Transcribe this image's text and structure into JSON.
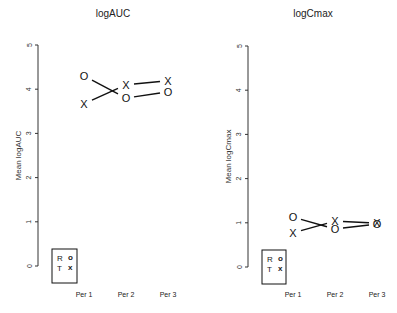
{
  "chart_data": [
    {
      "type": "line",
      "title": "logAUC",
      "xlabel": "",
      "ylabel": "Mean logAUC",
      "ylim": [
        0,
        5
      ],
      "yticks": [
        0,
        1,
        2,
        3,
        4,
        5
      ],
      "categories": [
        "Per 1",
        "Per 2",
        "Per 3"
      ],
      "grid": false,
      "legend": {
        "position": "bottom-left",
        "entries": [
          {
            "label": "R",
            "symbol": "O"
          },
          {
            "label": "T",
            "symbol": "X"
          }
        ]
      },
      "series": [
        {
          "name": "R",
          "symbol": "O",
          "values": [
            4.3,
            3.8,
            3.94
          ]
        },
        {
          "name": "T",
          "symbol": "X",
          "values": [
            3.67,
            4.1,
            4.19
          ]
        }
      ]
    },
    {
      "type": "line",
      "title": "logCmax",
      "xlabel": "",
      "ylabel": "Mean logCmax",
      "ylim": [
        0,
        5
      ],
      "yticks": [
        0,
        1,
        2,
        3,
        4,
        5
      ],
      "categories": [
        "Per 1",
        "Per 2",
        "Per 3"
      ],
      "grid": false,
      "legend": {
        "position": "bottom-left",
        "entries": [
          {
            "label": "R",
            "symbol": "O"
          },
          {
            "label": "T",
            "symbol": "X"
          }
        ]
      },
      "series": [
        {
          "name": "R",
          "symbol": "O",
          "values": [
            1.13,
            0.86,
            0.97
          ]
        },
        {
          "name": "T",
          "symbol": "X",
          "values": [
            0.77,
            1.04,
            0.99
          ]
        }
      ]
    }
  ],
  "layout": [
    {
      "axis_x": 38,
      "y0": 266,
      "y5": 45,
      "cat_x": [
        84,
        126,
        168
      ],
      "title_x": 113,
      "ylab_x": 18,
      "legend_box": [
        52,
        249,
        25,
        34
      ]
    },
    {
      "axis_x": 248,
      "y0": 267,
      "y5": 46,
      "cat_x": [
        293,
        335,
        377
      ],
      "title_x": 313,
      "ylab_x": 228,
      "legend_box": [
        262,
        250,
        24,
        34
      ]
    }
  ]
}
